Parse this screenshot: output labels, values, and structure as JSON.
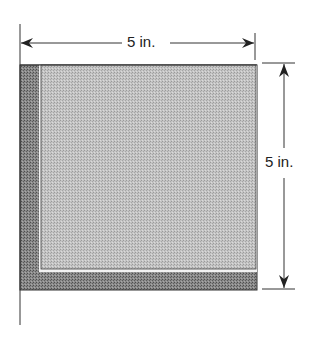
{
  "diagram": {
    "top_dimension": {
      "label": "5 in."
    },
    "right_dimension": {
      "label": "5 in."
    },
    "colors": {
      "outer_shade": "#7d7d7d",
      "inner_shade": "#b9b9b9",
      "gap_line": "#f2f2f2",
      "line": "#222222"
    }
  }
}
